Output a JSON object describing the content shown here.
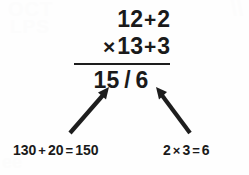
{
  "document": {
    "kind": "handwriting-worksheet-scan",
    "ink_color": "#1a1a1a",
    "paper_color": "#fefefe"
  },
  "sum": {
    "row1": {
      "term_a": "12",
      "operator": "+",
      "term_b": "2"
    },
    "row2": {
      "lead_operator": "×",
      "term_a": "13",
      "operator": "+",
      "term_b": "3"
    },
    "result": {
      "left": "15",
      "separator": "/",
      "right": "6"
    }
  },
  "annotations": {
    "left": {
      "a": "130",
      "op": "+",
      "b": "20",
      "eq": "=",
      "result": "150",
      "points_to": "15"
    },
    "right": {
      "a": "2",
      "op": "×",
      "b": "3",
      "eq": "=",
      "result": "6",
      "points_to": "6"
    }
  },
  "arrows": {
    "left": {
      "from_x": 70,
      "from_y": 133,
      "to_x": 109,
      "to_y": 88
    },
    "right": {
      "from_x": 190,
      "from_y": 133,
      "to_x": 156,
      "to_y": 88
    },
    "color": "#1d1d1d"
  },
  "ghosts": {
    "top_left_1": "OCT",
    "top_left_2": "LPS",
    "top_right": "\\\\",
    "bottom_left": "ee"
  }
}
